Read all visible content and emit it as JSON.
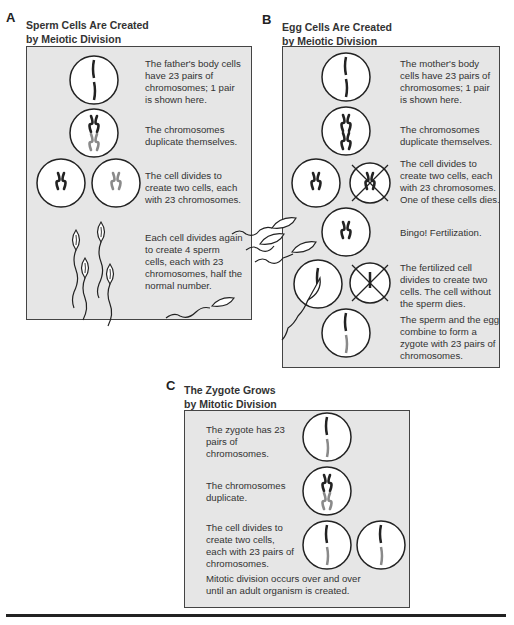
{
  "panelA": {
    "letter": "A",
    "title_line1": "Sperm Cells Are Created",
    "title_line2": "by Meiotic Division",
    "steps": [
      "The father's body cells have 23 pairs of chromosomes; 1 pair is shown here.",
      "The chromosomes duplicate themselves.",
      "The cell divides to create two cells, each with 23 chromosomes.",
      "Each cell divides again to create 4 sperm cells, each with 23 chromosomes, half the normal number."
    ]
  },
  "panelB": {
    "letter": "B",
    "title_line1": "Egg Cells Are Created",
    "title_line2": "by Meiotic Division",
    "steps": [
      "The mother's body cells have 23 pairs of chromosomes; 1 pair is shown here.",
      "The chromosomes duplicate themselves.",
      "The cell divides to create two cells, each with 23 chromosomes. One of these cells dies.",
      "Bingo! Fertilization.",
      "The fertilized cell divides to create two cells. The cell without the sperm dies.",
      "The sperm and the egg combine to form a zygote with 23 pairs of chromosomes."
    ]
  },
  "panelC": {
    "letter": "C",
    "title_line1": "The Zygote Grows",
    "title_line2": "by Mitotic Division",
    "steps": [
      "The zygote has 23 pairs of chromosomes.",
      "The chromosomes duplicate.",
      "The cell divides to create two cells, each with 23 pairs of chromosomes.",
      "Mitotic division occurs over and over until an adult organism is created."
    ]
  },
  "colors": {
    "panel_bg": "#e6e6e6",
    "paternal_chromosome": "#222222",
    "maternal_chromosome": "#8a8a8a"
  }
}
